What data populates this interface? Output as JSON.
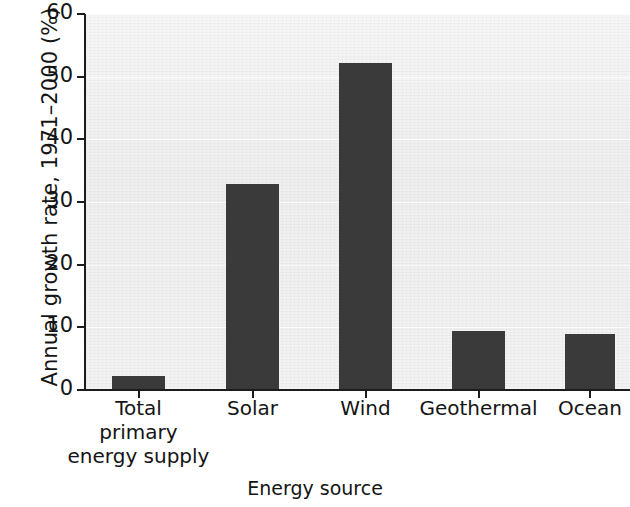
{
  "chart_data": {
    "type": "bar",
    "title": "",
    "xlabel": "Energy source",
    "ylabel": "Annual growth rate, 1971–2000 (%)",
    "categories": [
      "Total primary energy supply",
      "Solar",
      "Wind",
      "Geothermal",
      "Ocean"
    ],
    "category_lines": [
      [
        "Total",
        "primary",
        "energy supply"
      ],
      [
        "Solar"
      ],
      [
        "Wind"
      ],
      [
        "Geothermal"
      ],
      [
        "Ocean"
      ]
    ],
    "values": [
      2.2,
      32.8,
      52.2,
      9.4,
      9.0
    ],
    "ylim": [
      0,
      60
    ],
    "yticks": [
      0,
      10,
      20,
      30,
      40,
      50,
      60
    ],
    "ytick_labels": [
      "0",
      "10",
      "20",
      "30",
      "40",
      "50",
      "60"
    ],
    "grid": true,
    "legend": "none",
    "bar_color": "#3a3a3a",
    "plot_background": "#f1f1f1",
    "axis_color": "#1c1c1c"
  },
  "axes": {
    "y_title": "Annual growth rate, 1971–2000 (%)",
    "x_title": "Energy source"
  }
}
